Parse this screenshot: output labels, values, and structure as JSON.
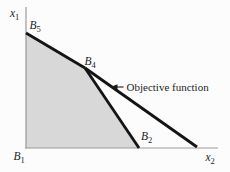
{
  "figure": {
    "type": "linear-programming feasible-region diagram",
    "axis_labels": {
      "vertical": {
        "base": "x",
        "sub": "1"
      },
      "horizontal": {
        "base": "x",
        "sub": "2"
      }
    },
    "vertex_labels": {
      "b1": {
        "base": "B",
        "sub": "1"
      },
      "b2": {
        "base": "B",
        "sub": "2"
      },
      "b4": {
        "base": "B",
        "sub": "4"
      },
      "b5": {
        "base": "B",
        "sub": "5"
      }
    },
    "annotation": {
      "label": "Objective function",
      "arrow": "left-arrow"
    },
    "elements": {
      "feasible_region": "shaded polygon bounded by axes, line B5-B4 and line B4-B2",
      "lines": [
        "constraint B5-B4",
        "constraint B4-B2",
        "objective function line through B4"
      ]
    },
    "colors": {
      "background": "#fcfcfc",
      "region_fill": "#d8d8d8",
      "line": "#141414",
      "axis": "#9a9a9a",
      "text": "#1c1c1c"
    }
  }
}
